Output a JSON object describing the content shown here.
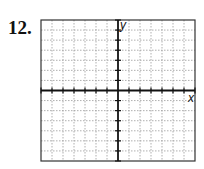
{
  "problem": {
    "number": "12."
  },
  "chart_data": {
    "type": "scatter",
    "title": "",
    "xlabel": "x",
    "ylabel": "y",
    "xlim": [
      -7,
      7
    ],
    "ylim": [
      -7,
      7
    ],
    "grid": true,
    "x_ticks": [
      -7,
      -6,
      -5,
      -4,
      -3,
      -2,
      -1,
      1,
      2,
      3,
      4,
      5,
      6,
      7
    ],
    "y_ticks": [
      -7,
      -6,
      -5,
      -4,
      -3,
      -2,
      -1,
      1,
      2,
      3,
      4,
      5,
      6,
      7
    ],
    "points": [],
    "legend": null
  },
  "axes": {
    "x_label": "x",
    "y_label": "y"
  },
  "colors": {
    "axis": "#111111",
    "grid": "#9a9a9a",
    "border": "#333333"
  }
}
